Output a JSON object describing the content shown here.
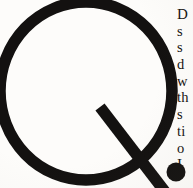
{
  "page": {
    "kind": "scanned-book-page-crop",
    "background_color": "#fdfcfa",
    "ink_color": "#131110",
    "width": 193,
    "height": 188
  },
  "dropcap": {
    "letter": "Q",
    "style": "geometric-sans-ring-with-diagonal-tail",
    "color": "#131110",
    "ring": {
      "center_x": 86,
      "center_y": 91,
      "radius_x": 86,
      "radius_y": 89,
      "stroke_width": 11
    },
    "tail": {
      "start_x": 100,
      "start_y": 107,
      "end_x": 166,
      "end_y": 192,
      "stroke_width": 11
    },
    "period_dot": {
      "center_x": 176,
      "center_y": 172,
      "radius": 9
    },
    "cropped_edges": [
      "top",
      "left",
      "bottom"
    ]
  },
  "body_text": {
    "column_clipped": true,
    "visible_prefix_only": true,
    "lines": [
      "D",
      "s",
      "s",
      "d",
      "w",
      "th",
      "s",
      "ti",
      "o",
      "I"
    ]
  }
}
